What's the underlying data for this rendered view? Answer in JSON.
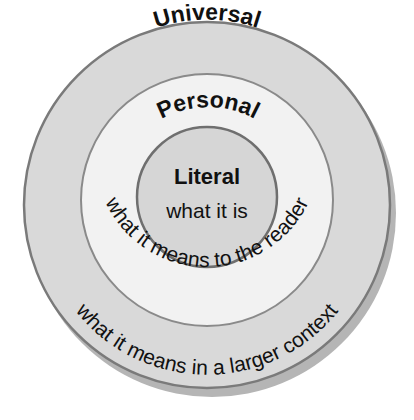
{
  "diagram": {
    "type": "concentric-circles",
    "colors": {
      "background": "#ffffff",
      "outer_fill": "#d9d9d9",
      "middle_fill": "#f2f2f2",
      "inner_fill": "#d6d6d6",
      "stroke": "#7a7a7a",
      "shadow": "#b5b5b5",
      "text": "#111111"
    },
    "rings": [
      {
        "id": "universal",
        "title": "Universal",
        "description": "what it means in a larger context"
      },
      {
        "id": "personal",
        "title": "Personal",
        "description": "what it means to the reader"
      },
      {
        "id": "literal",
        "title": "Literal",
        "description": "what it is"
      }
    ]
  }
}
